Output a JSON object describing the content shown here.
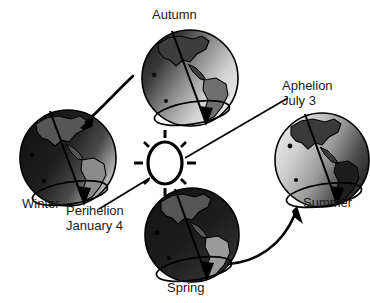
{
  "diagram": {
    "background_color": "#ffffff",
    "ink_color": "#000000",
    "sun": {
      "name": "Sun",
      "shape": "ellipse-outline-with-rays",
      "fill": "#ffffff",
      "stroke": "#000000",
      "ray_count": 8
    },
    "labels": {
      "autumn": "Autumn",
      "winter": "Winter",
      "spring": "Spring",
      "summer": "Summer",
      "aphelion_line1": "Aphelion",
      "aphelion_line2": "July 3",
      "perihelion_line1": "Perihelion",
      "perihelion_line2": "January 4"
    },
    "globes": [
      {
        "id": "autumn",
        "label": "Autumn",
        "position": "top",
        "lit_side": "right",
        "shaded_side": "left",
        "has_axis": true,
        "has_orbit_ellipse": true,
        "axis_arrow": "down"
      },
      {
        "id": "winter",
        "label": "Winter",
        "position": "left",
        "lit_side": "right",
        "shaded_side": "left",
        "has_axis": true,
        "has_orbit_ellipse": true,
        "axis_arrow": "down"
      },
      {
        "id": "spring",
        "label": "Spring",
        "position": "bottom",
        "lit_side": "right",
        "shaded_side": "left",
        "has_axis": true,
        "has_orbit_ellipse": true,
        "axis_arrow": "down"
      },
      {
        "id": "summer",
        "label": "Summer",
        "position": "right",
        "lit_side": "left",
        "shaded_side": "right",
        "has_axis": true,
        "has_orbit_ellipse": true,
        "axis_arrow": "down"
      }
    ],
    "motion_arrows": [
      {
        "id": "autumn-to-winter",
        "from": "Autumn",
        "to": "Winter",
        "style": "curved-arrow"
      },
      {
        "id": "spring-to-summer",
        "from": "Spring",
        "to": "Summer",
        "style": "curved-arrow"
      }
    ],
    "leader_lines": [
      {
        "id": "aphelion-leader",
        "from_label": "Aphelion July 3",
        "points_to": "Sun"
      },
      {
        "id": "perihelion-leader",
        "from_label": "Perihelion January 4",
        "points_to": "Sun"
      }
    ]
  }
}
